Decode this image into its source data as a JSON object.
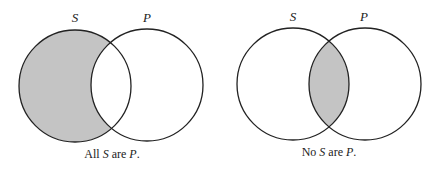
{
  "colors": {
    "shade": "#c4c4c4",
    "stroke": "#222222",
    "background": "#ffffff"
  },
  "diagrams": [
    {
      "id": "all-s-are-p",
      "circles": {
        "S": {
          "label": "S",
          "cx": 75,
          "cy": 86,
          "r": 56
        },
        "P": {
          "label": "P",
          "cx": 147,
          "cy": 85,
          "r": 56
        }
      },
      "shaded_region": "S minus P",
      "caption": {
        "pre": "All ",
        "s": "S",
        "mid": " are ",
        "p": "P",
        "post": "."
      }
    },
    {
      "id": "no-s-are-p",
      "circles": {
        "S": {
          "label": "S",
          "cx": 293,
          "cy": 84,
          "r": 56
        },
        "P": {
          "label": "P",
          "cx": 365,
          "cy": 84,
          "r": 56
        }
      },
      "shaded_region": "S intersect P",
      "caption": {
        "pre": "No ",
        "s": "S",
        "mid": " are ",
        "p": "P",
        "post": "."
      }
    }
  ]
}
